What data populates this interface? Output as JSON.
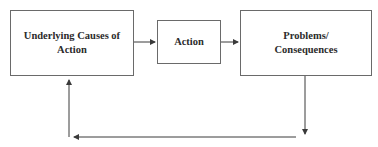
{
  "diagram": {
    "type": "flow-cycle",
    "nodes": [
      {
        "id": "causes",
        "label_line1": "Underlying Causes of",
        "label_line2": "Action"
      },
      {
        "id": "action",
        "label_line1": "Action"
      },
      {
        "id": "problems",
        "label_line1": "Problems/",
        "label_line2": "Consequences"
      }
    ],
    "edges": [
      {
        "from": "causes",
        "to": "action"
      },
      {
        "from": "action",
        "to": "problems"
      },
      {
        "from": "problems",
        "to": "causes",
        "route": "down-left-up feedback loop"
      }
    ],
    "colors": {
      "line": "#3a3a3a",
      "border": "#6a6a6a",
      "text": "#2b2b2b",
      "background": "#ffffff"
    }
  }
}
